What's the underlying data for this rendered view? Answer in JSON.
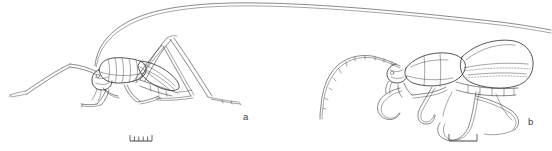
{
  "plate": {
    "width": 552,
    "height": 151,
    "background_color": "#ffffff",
    "ink_color": "#2b2b2b",
    "scalebar_color": "#555555",
    "figure_count": 2
  },
  "figures": [
    {
      "key": "a",
      "label": "a",
      "subject": "long-horned grasshopper / katydid, lateral view",
      "has_long_antenna": true,
      "scalebar": {
        "style": "ruler",
        "tick_count": 5,
        "width_px": 22,
        "height_px": 6
      }
    },
    {
      "key": "b",
      "label": "b",
      "subject": "beetle with elytra, lateral view",
      "has_long_antenna": true,
      "scalebar": {
        "style": "bracket",
        "tick_count": 2,
        "width_px": 28,
        "height_px": 7
      }
    }
  ],
  "labels": {
    "figure_a": "a",
    "figure_b": "b"
  }
}
